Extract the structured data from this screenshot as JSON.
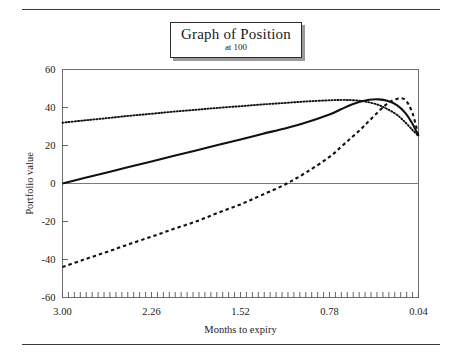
{
  "figure": {
    "title": "Graph of Position",
    "subtitle": "at 100",
    "xlabel": "Months to expiry",
    "ylabel": "Portfolio value"
  },
  "chart_data": {
    "type": "line",
    "title": "Graph of Position",
    "subtitle": "at 100",
    "xlabel": "Months to expiry",
    "ylabel": "Portfolio value",
    "xlim": [
      3.0,
      0.04
    ],
    "ylim": [
      -60,
      60
    ],
    "x_reversed": true,
    "grid": false,
    "legend": "none",
    "xticks": [
      "3.00",
      "2.26",
      "1.52",
      "0.78",
      "0.04"
    ],
    "xtick_values": [
      3.0,
      2.26,
      1.52,
      0.78,
      0.04
    ],
    "yticks": [
      "60",
      "40",
      "20",
      "0",
      "-20",
      "-40",
      "-60"
    ],
    "ytick_values": [
      60,
      40,
      20,
      0,
      -20,
      -40,
      -60
    ],
    "zero_line": 0,
    "minor_xticks": 60,
    "x": [
      3.0,
      2.82,
      2.63,
      2.45,
      2.26,
      2.08,
      1.89,
      1.71,
      1.52,
      1.34,
      1.15,
      0.97,
      0.78,
      0.68,
      0.6,
      0.52,
      0.45,
      0.37,
      0.3,
      0.22,
      0.15,
      0.09,
      0.04
    ],
    "series": [
      {
        "name": "dotted-curve",
        "style": "dotted",
        "values": [
          32.0,
          33.2,
          34.4,
          35.6,
          36.7,
          37.8,
          38.8,
          39.8,
          40.7,
          41.6,
          42.4,
          43.2,
          43.8,
          44.0,
          43.9,
          43.5,
          42.7,
          41.3,
          39.2,
          36.2,
          32.2,
          28.2,
          25.0
        ]
      },
      {
        "name": "solid-curve",
        "style": "solid",
        "values": [
          0.0,
          2.9,
          5.8,
          8.7,
          11.6,
          14.5,
          17.4,
          20.3,
          23.2,
          26.1,
          29.0,
          32.2,
          36.3,
          39.2,
          41.4,
          43.1,
          44.1,
          44.3,
          43.5,
          41.3,
          37.2,
          31.4,
          25.0
        ]
      },
      {
        "name": "dashed-curve",
        "style": "dashed",
        "values": [
          -44.0,
          -40.0,
          -36.0,
          -32.0,
          -28.0,
          -24.0,
          -20.0,
          -15.5,
          -11.0,
          -6.0,
          -0.5,
          6.0,
          14.0,
          19.5,
          24.0,
          28.5,
          33.0,
          38.0,
          42.0,
          44.5,
          44.0,
          37.0,
          25.0
        ]
      }
    ]
  }
}
